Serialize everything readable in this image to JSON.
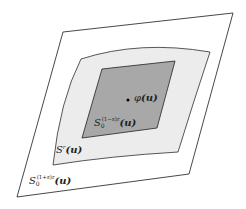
{
  "diagram": {
    "type": "nested-regions",
    "colors": {
      "background": "#ffffff",
      "outer_fill": "#ffffff",
      "outer_stroke": "#333333",
      "middle_fill": "#ececec",
      "middle_stroke": "#444444",
      "inner_fill": "#a8a8a8",
      "inner_stroke": "#333333",
      "point": "#000000"
    },
    "regions": [
      {
        "id": "outer",
        "label_base": "S",
        "label_sub": "0",
        "label_sup": "(1+ε)r",
        "label_arg": "(u)",
        "shape": "parallelogram"
      },
      {
        "id": "middle",
        "label_base": "S",
        "label_sup": "r",
        "label_arg": "(u)",
        "shape": "curved-quadrilateral"
      },
      {
        "id": "inner",
        "label_base": "S",
        "label_sub": "0",
        "label_sup": "(1−ε)r",
        "label_arg": "(u)",
        "shape": "parallelogram"
      }
    ],
    "point": {
      "label_func": "φ",
      "label_arg": "(u)"
    }
  }
}
